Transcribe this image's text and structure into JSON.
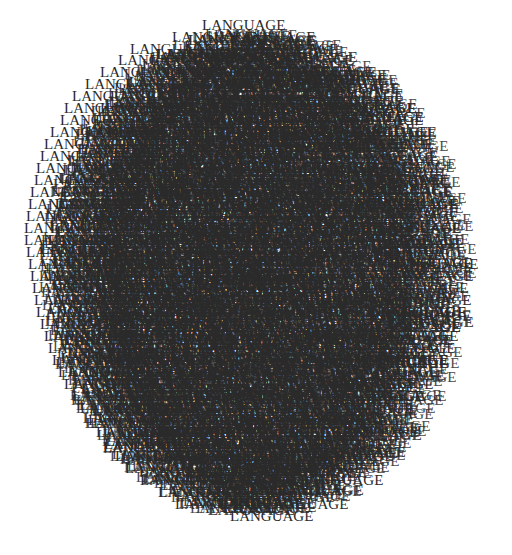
{
  "artwork": {
    "word": "LANGUAGE",
    "text_color": "#2a2a2a",
    "background": "#ffffff",
    "layout": {
      "shape": "ellipse",
      "center_x": 256,
      "center_y": 278,
      "radius_x": 218,
      "radius_y": 248
    },
    "rows": [
      {
        "y": 33,
        "x": [
          202
        ]
      },
      {
        "y": 45,
        "x": [
          172,
          232
        ]
      },
      {
        "y": 57,
        "x": [
          130,
          185,
          255
        ]
      },
      {
        "y": 68,
        "x": [
          118,
          150,
          210,
          270
        ]
      },
      {
        "y": 80,
        "x": [
          100,
          140,
          190,
          240,
          290
        ]
      },
      {
        "y": 92,
        "x": [
          85,
          125,
          170,
          220,
          300
        ]
      },
      {
        "y": 104,
        "x": [
          72,
          110,
          160,
          210,
          260,
          320
        ]
      },
      {
        "y": 116,
        "x": [
          64,
          100,
          150,
          200,
          250,
          330
        ]
      },
      {
        "y": 128,
        "x": [
          60,
          95,
          140,
          190,
          240,
          290,
          340
        ]
      },
      {
        "y": 140,
        "x": [
          50,
          85,
          130,
          180,
          230,
          280,
          345
        ]
      },
      {
        "y": 152,
        "x": [
          44,
          80,
          125,
          170,
          220,
          270,
          350
        ]
      },
      {
        "y": 164,
        "x": [
          40,
          75,
          120,
          165,
          215,
          265,
          355
        ]
      },
      {
        "y": 176,
        "x": [
          36,
          72,
          115,
          160,
          210,
          260,
          310,
          360
        ]
      },
      {
        "y": 188,
        "x": [
          34,
          68,
          110,
          155,
          205,
          255,
          305,
          365
        ]
      },
      {
        "y": 200,
        "x": [
          30,
          60,
          105,
          150,
          200,
          250,
          300,
          370
        ]
      },
      {
        "y": 212,
        "x": [
          28,
          55,
          100,
          145,
          195,
          245,
          295,
          372
        ]
      },
      {
        "y": 224,
        "x": [
          26,
          52,
          98,
          142,
          190,
          240,
          290,
          375
        ]
      },
      {
        "y": 236,
        "x": [
          24,
          50,
          95,
          140,
          188,
          238,
          288,
          378
        ]
      },
      {
        "y": 248,
        "x": [
          24,
          48,
          92,
          138,
          185,
          235,
          285,
          380
        ]
      },
      {
        "y": 260,
        "x": [
          26,
          50,
          90,
          135,
          182,
          232,
          282,
          382
        ]
      },
      {
        "y": 272,
        "x": [
          28,
          52,
          92,
          136,
          183,
          233,
          283,
          395
        ]
      },
      {
        "y": 284,
        "x": [
          30,
          55,
          95,
          138,
          185,
          235,
          285,
          390
        ]
      },
      {
        "y": 296,
        "x": [
          32,
          58,
          98,
          140,
          188,
          238,
          288,
          385
        ]
      },
      {
        "y": 308,
        "x": [
          34,
          60,
          100,
          142,
          190,
          240,
          290,
          388
        ]
      },
      {
        "y": 320,
        "x": [
          36,
          62,
          102,
          145,
          192,
          242,
          292,
          380
        ]
      },
      {
        "y": 332,
        "x": [
          40,
          66,
          105,
          148,
          195,
          245,
          295,
          378
        ]
      },
      {
        "y": 344,
        "x": [
          44,
          70,
          108,
          150,
          198,
          248,
          298,
          375
        ]
      },
      {
        "y": 356,
        "x": [
          48,
          74,
          112,
          155,
          200,
          250,
          300,
          372
        ]
      },
      {
        "y": 368,
        "x": [
          52,
          78,
          116,
          160,
          205,
          255,
          305,
          365
        ]
      },
      {
        "y": 380,
        "x": [
          58,
          84,
          120,
          165,
          210,
          260,
          355
        ]
      },
      {
        "y": 392,
        "x": [
          64,
          90,
          125,
          170,
          215,
          265,
          350
        ]
      },
      {
        "y": 404,
        "x": [
          72,
          96,
          130,
          175,
          220,
          270,
          340
        ]
      },
      {
        "y": 416,
        "x": [
          80,
          104,
          135,
          180,
          225,
          275,
          330
        ]
      },
      {
        "y": 428,
        "x": [
          88,
          112,
          140,
          185,
          230,
          280,
          320
        ]
      },
      {
        "y": 440,
        "x": [
          96,
          120,
          150,
          190,
          235,
          290,
          335
        ]
      },
      {
        "y": 452,
        "x": [
          104,
          130,
          165,
          200,
          245,
          300
        ]
      },
      {
        "y": 464,
        "x": [
          115,
          145,
          180,
          215,
          260,
          310
        ]
      },
      {
        "y": 476,
        "x": [
          125,
          160,
          195,
          235,
          280
        ]
      },
      {
        "y": 488,
        "x": [
          140,
          175,
          215,
          255,
          300
        ]
      },
      {
        "y": 500,
        "x": [
          158,
          195,
          240
        ]
      },
      {
        "y": 512,
        "x": [
          175,
          220,
          265
        ]
      },
      {
        "y": 524,
        "x": [
          230
        ]
      }
    ],
    "fill_layers": 3,
    "font_size_px": 15,
    "bold_rows": [
      116,
      212,
      320
    ]
  }
}
